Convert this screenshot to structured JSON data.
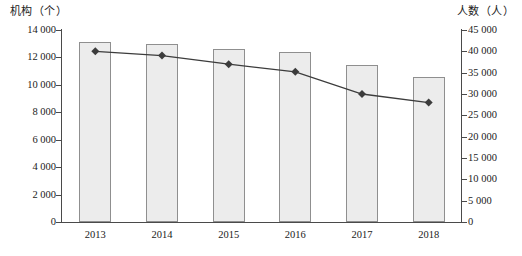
{
  "chart_data": {
    "type": "bar",
    "title": "",
    "subtitle": "",
    "categories": [
      "2013",
      "2014",
      "2015",
      "2016",
      "2017",
      "2018"
    ],
    "xlabel": "",
    "grid": false,
    "legend": "none",
    "axes": {
      "left": {
        "label": "机构（个）",
        "unit": "个",
        "min": 0,
        "max": 14000,
        "step": 2000,
        "ticks": [
          "0",
          "2 000",
          "4 000",
          "6 000",
          "8 000",
          "10 000",
          "12 000",
          "14 000"
        ],
        "tick_values": [
          0,
          2000,
          4000,
          6000,
          8000,
          10000,
          12000,
          14000
        ]
      },
      "right": {
        "label": "人数（人）",
        "unit": "人",
        "min": 0,
        "max": 45000,
        "step": 5000,
        "ticks": [
          "0",
          "5 000",
          "10 000",
          "15 000",
          "20 000",
          "25 000",
          "30 000",
          "35 000",
          "40 000",
          "45 000"
        ],
        "tick_values": [
          0,
          5000,
          10000,
          15000,
          20000,
          25000,
          30000,
          35000,
          40000,
          45000
        ]
      }
    },
    "series": [
      {
        "name": "机构（个）",
        "type": "bar",
        "axis": "left",
        "color": "#ececec",
        "border_color": "#8f8f8f",
        "values": [
          13100,
          12950,
          12650,
          12400,
          11450,
          10550
        ]
      },
      {
        "name": "人数（人）",
        "type": "line",
        "axis": "right",
        "color": "#3c3c3c",
        "marker": "diamond",
        "values": [
          40000,
          39000,
          37000,
          35200,
          30000,
          28000
        ]
      }
    ]
  }
}
